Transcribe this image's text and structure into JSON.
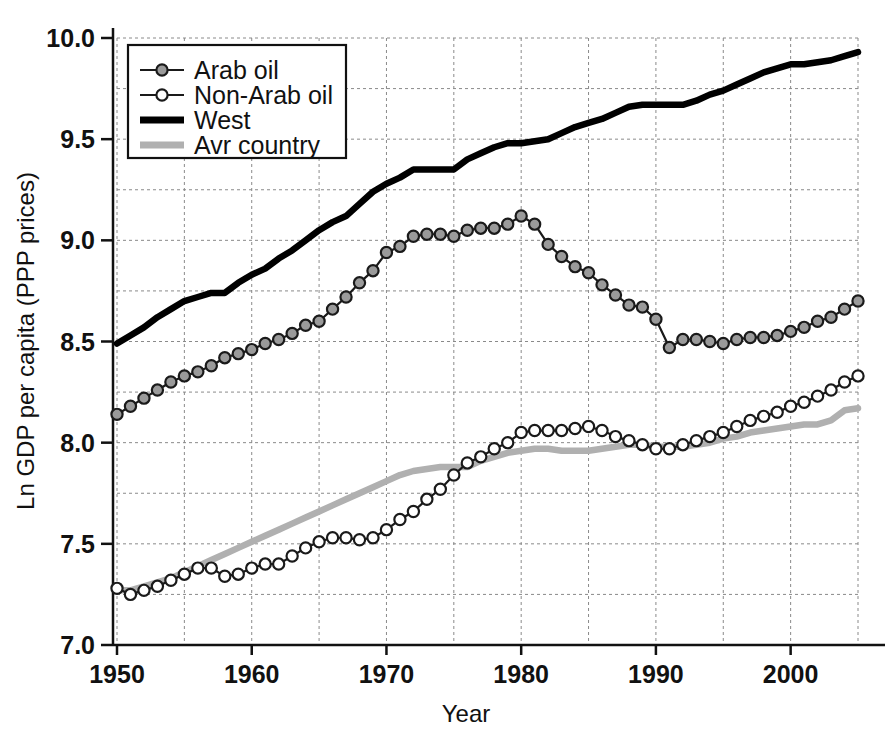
{
  "chart_data": {
    "type": "line",
    "title": "",
    "xlabel": "Year",
    "ylabel": "Ln GDP per capita (PPP prices)",
    "xlim": [
      1950,
      2005
    ],
    "ylim": [
      7.0,
      10.0
    ],
    "xticks": [
      1950,
      1960,
      1970,
      1980,
      1990,
      2000
    ],
    "xtick_labels": [
      "1950",
      "1960",
      "1970",
      "1980",
      "1990",
      "2000"
    ],
    "yticks": [
      7.0,
      7.5,
      8.0,
      8.5,
      9.0,
      9.5,
      10.0
    ],
    "ytick_labels": [
      "7.0",
      "7.5",
      "8.0",
      "8.5",
      "9.0",
      "9.5",
      "10.0"
    ],
    "grid": true,
    "grid_minor_x_step": 5,
    "grid_minor_y_step": 0.25,
    "legend_position": "upper-left",
    "x": [
      1950,
      1951,
      1952,
      1953,
      1954,
      1955,
      1956,
      1957,
      1958,
      1959,
      1960,
      1961,
      1962,
      1963,
      1964,
      1965,
      1966,
      1967,
      1968,
      1969,
      1970,
      1971,
      1972,
      1973,
      1974,
      1975,
      1976,
      1977,
      1978,
      1979,
      1980,
      1981,
      1982,
      1983,
      1984,
      1985,
      1986,
      1987,
      1988,
      1989,
      1990,
      1991,
      1992,
      1993,
      1994,
      1995,
      1996,
      1997,
      1998,
      1999,
      2000,
      2001,
      2002,
      2003,
      2004,
      2005
    ],
    "series": [
      {
        "name": "Arab oil",
        "color": "#9a9a9a",
        "line_color": "#1a1a1a",
        "marker": "filled-circle",
        "values": [
          8.14,
          8.18,
          8.22,
          8.26,
          8.3,
          8.33,
          8.35,
          8.38,
          8.42,
          8.44,
          8.46,
          8.49,
          8.51,
          8.54,
          8.58,
          8.6,
          8.66,
          8.72,
          8.79,
          8.85,
          8.94,
          8.97,
          9.02,
          9.03,
          9.03,
          9.02,
          9.05,
          9.06,
          9.06,
          9.08,
          9.12,
          9.08,
          8.98,
          8.92,
          8.87,
          8.84,
          8.78,
          8.73,
          8.68,
          8.67,
          8.61,
          8.47,
          8.51,
          8.51,
          8.5,
          8.49,
          8.51,
          8.52,
          8.52,
          8.53,
          8.55,
          8.57,
          8.6,
          8.62,
          8.66,
          8.7
        ]
      },
      {
        "name": "Non-Arab oil",
        "color": "#ffffff",
        "line_color": "#1a1a1a",
        "marker": "open-circle",
        "values": [
          7.28,
          7.25,
          7.27,
          7.29,
          7.32,
          7.35,
          7.38,
          7.38,
          7.34,
          7.35,
          7.38,
          7.4,
          7.4,
          7.44,
          7.48,
          7.51,
          7.53,
          7.53,
          7.52,
          7.53,
          7.57,
          7.62,
          7.66,
          7.72,
          7.77,
          7.84,
          7.9,
          7.93,
          7.97,
          8.0,
          8.05,
          8.06,
          8.06,
          8.06,
          8.07,
          8.08,
          8.06,
          8.03,
          8.01,
          7.99,
          7.97,
          7.97,
          7.99,
          8.01,
          8.03,
          8.05,
          8.08,
          8.11,
          8.13,
          8.15,
          8.18,
          8.2,
          8.23,
          8.26,
          8.3,
          8.33
        ]
      },
      {
        "name": "West",
        "color": "#000000",
        "line_color": "#000000",
        "marker": "none",
        "values": [
          8.49,
          8.53,
          8.57,
          8.62,
          8.66,
          8.7,
          8.72,
          8.74,
          8.74,
          8.79,
          8.83,
          8.86,
          8.91,
          8.95,
          9.0,
          9.05,
          9.09,
          9.12,
          9.18,
          9.24,
          9.28,
          9.31,
          9.35,
          9.35,
          9.35,
          9.35,
          9.4,
          9.43,
          9.46,
          9.48,
          9.48,
          9.49,
          9.5,
          9.53,
          9.56,
          9.58,
          9.6,
          9.63,
          9.66,
          9.67,
          9.67,
          9.67,
          9.67,
          9.69,
          9.72,
          9.74,
          9.77,
          9.8,
          9.83,
          9.85,
          9.87,
          9.87,
          9.88,
          9.89,
          9.91,
          9.93
        ]
      },
      {
        "name": "Avr country",
        "color": "#b0b0b0",
        "line_color": "#b0b0b0",
        "marker": "none",
        "values": [
          7.27,
          7.27,
          7.29,
          7.31,
          7.33,
          7.36,
          7.39,
          7.42,
          7.45,
          7.48,
          7.51,
          7.54,
          7.57,
          7.6,
          7.63,
          7.66,
          7.69,
          7.72,
          7.75,
          7.78,
          7.81,
          7.84,
          7.86,
          7.87,
          7.88,
          7.88,
          7.88,
          7.91,
          7.93,
          7.95,
          7.96,
          7.97,
          7.97,
          7.96,
          7.96,
          7.96,
          7.97,
          7.98,
          7.99,
          7.99,
          7.98,
          7.98,
          7.98,
          7.99,
          8.0,
          8.02,
          8.03,
          8.05,
          8.06,
          8.07,
          8.08,
          8.09,
          8.09,
          8.11,
          8.16,
          8.17
        ]
      }
    ],
    "legend": [
      {
        "label": "Arab oil",
        "marker": "filled-circle"
      },
      {
        "label": "Non-Arab oil",
        "marker": "open-circle"
      },
      {
        "label": "West",
        "marker": "thick-black-line"
      },
      {
        "label": "Avr country",
        "marker": "thick-gray-line"
      }
    ]
  }
}
